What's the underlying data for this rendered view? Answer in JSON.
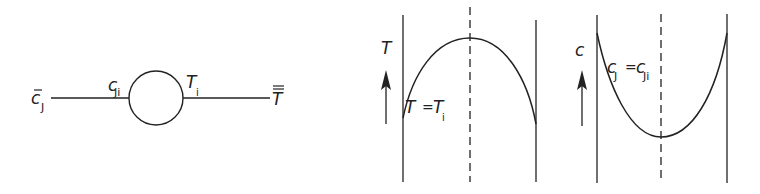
{
  "colors": {
    "ink": "#222222",
    "background": "#ffffff"
  },
  "particle_diagram": {
    "left_label": {
      "main": "c",
      "bar": "̄",
      "sub": "J"
    },
    "left_surface_label": {
      "main": "c",
      "sub": "Ji"
    },
    "right_surface_label": {
      "main": "T",
      "sub": "i"
    },
    "right_label": {
      "main": "T",
      "bar": "double"
    }
  },
  "temperature_profile": {
    "axis_label": "T",
    "boundary_label": {
      "lhs": "T",
      "eq": "=",
      "rhs": "T",
      "rhs_sub": "i"
    },
    "shape": "concave-down parabola, maximum at center"
  },
  "concentration_profile": {
    "axis_label": "c",
    "boundary_label": {
      "lhs": "c",
      "lhs_sub": "J",
      "eq": "=",
      "rhs": "c",
      "rhs_sub": "Ji"
    },
    "shape": "concave-up parabola, minimum at center"
  }
}
